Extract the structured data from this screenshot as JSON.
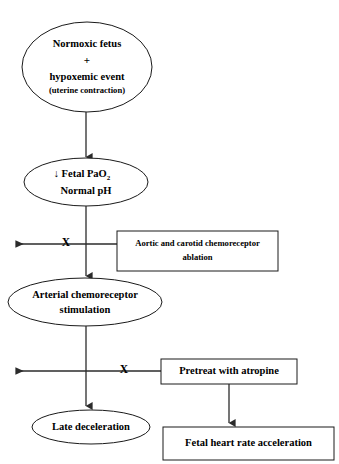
{
  "diagram": {
    "stroke_color": "#1a1a1a",
    "connector_color": "#2b2b2b",
    "text_color": "#000000",
    "background_color": "#ffffff"
  },
  "nodes": {
    "normoxic_fetus": {
      "shape": "ellipse",
      "line1": "Normoxic fetus",
      "line2": "+",
      "line3": "hypoxemic event",
      "line4": "(uterine contraction)"
    },
    "fetal_pao2": {
      "shape": "ellipse",
      "line1_prefix": "↓ Fetal PaO",
      "line1_sub": "2",
      "line2": "Normal pH"
    },
    "chemoreceptor_ablation": {
      "shape": "rectangle",
      "line1": "Aortic and carotid chemoreceptor",
      "line2": "ablation"
    },
    "arterial_stimulation": {
      "shape": "ellipse",
      "line1": "Arterial chemoreceptor",
      "line2": "stimulation"
    },
    "pretreat_atropine": {
      "shape": "rectangle",
      "line1": "Pretreat with atropine"
    },
    "late_deceleration": {
      "shape": "ellipse",
      "line1": "Late deceleration"
    },
    "fhr_acceleration": {
      "shape": "rectangle",
      "line1": "Fetal heart rate  acceleration"
    }
  },
  "markers": {
    "block_upper": "X",
    "block_lower": "X"
  }
}
